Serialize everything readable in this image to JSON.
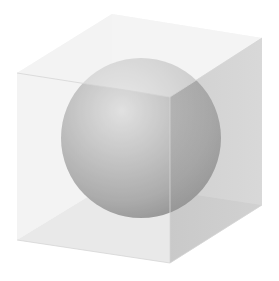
{
  "figure": {
    "canvas": {
      "width": 279,
      "height": 281,
      "background": "#ffffff"
    },
    "cube": {
      "vertices": {
        "front_top_left": [
          17,
          73
        ],
        "front_top_right": [
          170,
          97
        ],
        "front_bottom_right": [
          170,
          263
        ],
        "front_bottom_left": [
          17,
          240
        ],
        "back_top_left": [
          112,
          14
        ],
        "back_top_right": [
          262,
          38
        ],
        "back_bottom_right": [
          262,
          205
        ],
        "back_bottom_left": [
          112,
          182
        ]
      },
      "colors": {
        "front_face": "#ececec",
        "top_face": "#f2f2f2",
        "right_face": "#dcdcdc",
        "bottom_inner": "#e2e2e2",
        "edge": "#d0d0d0"
      },
      "opacity": {
        "front_face": 0.45,
        "top_face": 0.55,
        "right_face": 0.55
      }
    },
    "sphere": {
      "center": [
        141,
        138
      ],
      "radius": 80,
      "colors": {
        "highlight": "#d8d8d8",
        "mid": "#a8a8a8",
        "shadow": "#6e6e6e"
      }
    }
  }
}
